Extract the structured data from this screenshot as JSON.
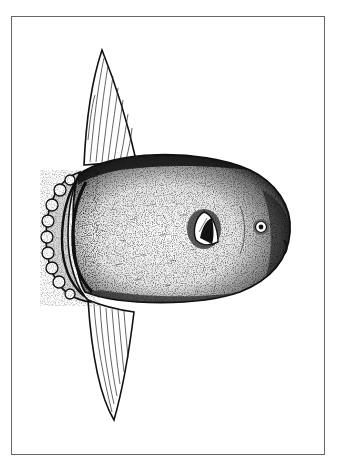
{
  "illustration": {
    "subject": "Ocean sunfish (Mola mola) stippled pen-and-ink drawing",
    "style": "black and white engraving",
    "frame_color": "#666666",
    "ink_color": "#111111",
    "background": "#ffffff"
  }
}
